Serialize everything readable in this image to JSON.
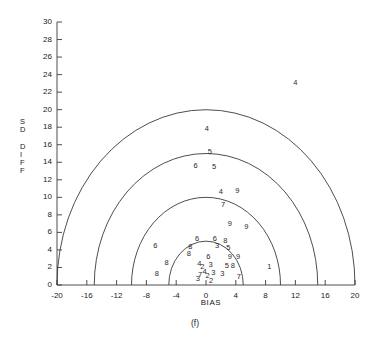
{
  "figure": {
    "caption": "(f)"
  },
  "chart_data": {
    "type": "scatter",
    "title": "",
    "subtitle": "",
    "xlabel": "BIAS",
    "ylabel": "SD DIFF",
    "ylabel_stacked": [
      "S",
      "D",
      "",
      "D",
      "I",
      "F",
      "F"
    ],
    "xlim": [
      -20,
      20
    ],
    "ylim": [
      0,
      30
    ],
    "xticks": [
      -20,
      -16,
      -12,
      -8,
      -4,
      0,
      4,
      8,
      12,
      16,
      20
    ],
    "xticklabels": [
      "-20",
      "-16",
      "-12",
      "-8",
      "-4",
      "0",
      "4",
      "8",
      "12",
      "16",
      "20"
    ],
    "yticks": [
      0,
      2,
      4,
      6,
      8,
      10,
      12,
      14,
      16,
      18,
      20,
      22,
      24,
      26,
      28,
      30
    ],
    "yticklabels": [
      "0",
      "2",
      "4",
      "6",
      "8",
      "10",
      "12",
      "14",
      "16",
      "18",
      "20",
      "22",
      "24",
      "26",
      "28",
      "30"
    ],
    "grid": false,
    "legend": null,
    "marker_style": "digit-label",
    "reference_arcs": {
      "description": "semicircles centered at (0,0) of constant total error radius",
      "center": [
        0,
        0
      ],
      "radii": [
        5,
        10,
        15,
        20
      ]
    },
    "points": [
      {
        "label": "4",
        "x": 12.0,
        "y": 23.0
      },
      {
        "label": "4",
        "x": 0.1,
        "y": 17.8
      },
      {
        "label": "5",
        "x": 0.5,
        "y": 15.2
      },
      {
        "label": "6",
        "x": -1.4,
        "y": 13.6
      },
      {
        "label": "5",
        "x": 1.1,
        "y": 13.5
      },
      {
        "label": "4",
        "x": 2.0,
        "y": 10.6
      },
      {
        "label": "9",
        "x": 4.2,
        "y": 10.7
      },
      {
        "label": "7",
        "x": 2.3,
        "y": 9.1
      },
      {
        "label": "9",
        "x": 3.2,
        "y": 7.0
      },
      {
        "label": "9",
        "x": 5.4,
        "y": 6.6
      },
      {
        "label": "6",
        "x": -1.2,
        "y": 5.2
      },
      {
        "label": "6",
        "x": 1.2,
        "y": 5.2
      },
      {
        "label": "8",
        "x": 2.6,
        "y": 5.0
      },
      {
        "label": "6",
        "x": -6.8,
        "y": 4.5
      },
      {
        "label": "8",
        "x": -2.1,
        "y": 4.3
      },
      {
        "label": "3",
        "x": 1.5,
        "y": 4.4
      },
      {
        "label": "5",
        "x": 3.0,
        "y": 4.2
      },
      {
        "label": "8",
        "x": -2.3,
        "y": 3.5
      },
      {
        "label": "6",
        "x": 0.3,
        "y": 3.2
      },
      {
        "label": "9",
        "x": 3.2,
        "y": 3.2
      },
      {
        "label": "9",
        "x": 4.3,
        "y": 3.2
      },
      {
        "label": "8",
        "x": -5.3,
        "y": 2.5
      },
      {
        "label": "4",
        "x": -0.9,
        "y": 2.4
      },
      {
        "label": "2",
        "x": -0.5,
        "y": 2.1
      },
      {
        "label": "3",
        "x": 0.6,
        "y": 2.3
      },
      {
        "label": "5",
        "x": 2.8,
        "y": 2.2
      },
      {
        "label": "8",
        "x": 3.6,
        "y": 2.2
      },
      {
        "label": "1",
        "x": 8.5,
        "y": 2.0
      },
      {
        "label": "8",
        "x": -6.6,
        "y": 1.3
      },
      {
        "label": "7",
        "x": -0.8,
        "y": 1.1
      },
      {
        "label": "4",
        "x": -0.2,
        "y": 1.5
      },
      {
        "label": "2",
        "x": 0.2,
        "y": 1.0
      },
      {
        "label": "3",
        "x": 1.0,
        "y": 1.4
      },
      {
        "label": "3",
        "x": 2.2,
        "y": 1.3
      },
      {
        "label": "7",
        "x": 4.4,
        "y": 0.9
      },
      {
        "label": "3",
        "x": -1.1,
        "y": 0.7
      },
      {
        "label": "2",
        "x": 0.7,
        "y": 0.5
      }
    ]
  }
}
